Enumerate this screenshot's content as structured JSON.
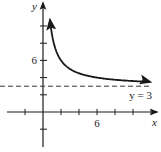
{
  "chart_data": {
    "type": "line",
    "title": "",
    "xlabel": "x",
    "ylabel": "y",
    "xlim": [
      -4,
      13
    ],
    "ylim": [
      -4,
      13
    ],
    "x_ticks": [
      -2,
      2,
      4,
      6,
      8,
      10,
      12
    ],
    "y_ticks": [
      -2,
      2,
      4,
      6,
      8,
      10
    ],
    "x_tick_labels": [
      {
        "value": 6,
        "label": "6"
      }
    ],
    "y_tick_labels": [
      {
        "value": 6,
        "label": "6"
      }
    ],
    "series": [
      {
        "name": "curve",
        "function": "y = 3 + 6/x",
        "x": [
          0.5,
          0.75,
          1,
          1.5,
          2,
          3,
          4,
          5,
          6,
          8,
          10,
          12
        ],
        "y": [
          15,
          11,
          9,
          7,
          6,
          5,
          4.5,
          4.2,
          4,
          3.75,
          3.6,
          3.5
        ]
      }
    ],
    "asymptote": {
      "value": 3,
      "label": "y = 3",
      "style": "dashed"
    },
    "grid": false,
    "colors": {
      "ink": "#1a1a1a"
    }
  }
}
